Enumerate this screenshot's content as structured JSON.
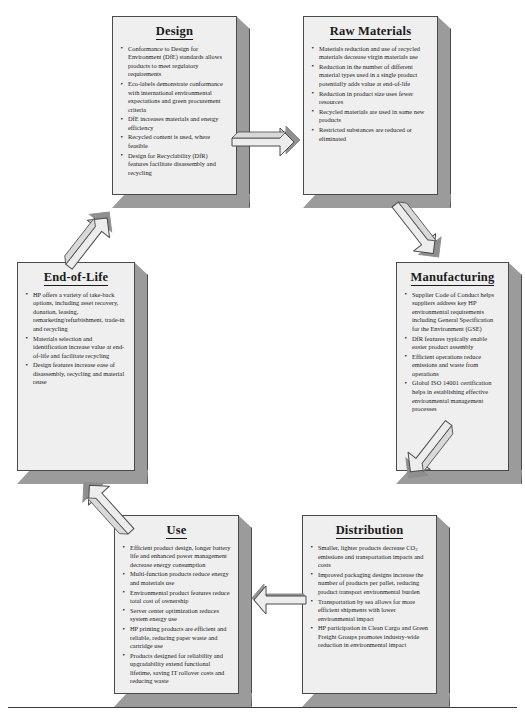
{
  "diagram": {
    "type": "cycle-flow",
    "colors": {
      "box_face": "#efefef",
      "box_shadow": "#9b9b9b",
      "outline": "#4a4a4a",
      "arrow_fill": "#ededed",
      "arrow_shadow": "#8f8f8f",
      "text": "#1a1a1a"
    },
    "stages": [
      {
        "id": "design",
        "title": "Design",
        "bullets": [
          "Conformance to Design for Environment (DfE) standards allows products to meet regulatory requirements",
          "Eco-labels demonstrate conformance with international environmental expectations and green procurement criteria",
          "DfE increases materials and energy efficiency",
          "Recycled content is used, where feasible",
          "Design for Recyclability (DfR) features facilitate disassembly and recycling"
        ]
      },
      {
        "id": "raw-materials",
        "title": "Raw Materials",
        "bullets": [
          "Materials reduction and use of recycled materials decrease virgin materials use",
          "Reduction in the number of different material types used in a single product potentially adds value at end-of-life",
          "Reduction in product size uses fewer resources",
          "Recycled materials are used in some new products",
          "Restricted substances are reduced or eliminated"
        ]
      },
      {
        "id": "manufacturing",
        "title": "Manufacturing",
        "bullets": [
          "Supplier Code of Conduct helps suppliers address key HP environmental requirements including General Specification for the Environment (GSE)",
          "DfR features typically enable easier product assembly",
          "Efficient operations reduce emissions and waste from operations",
          "Global ISO 14001 certification helps in establishing effective environmental management processes"
        ]
      },
      {
        "id": "distribution",
        "title": "Distribution",
        "bullets": [
          "Smaller, lighter products decrease CO2 emissions and transportation impacts and costs",
          "Improved packaging designs increase the number of products per pallet, reducing product transport environmental burden",
          "Transportation by sea allows for more efficient shipments with lower environmental impact",
          "HP participation in Clean Cargo and Green Freight Groups promotes industry-wide reduction in environmental impact"
        ]
      },
      {
        "id": "use",
        "title": "Use",
        "bullets": [
          "Efficient product design, longer battery life and enhanced power management decrease energy consumption",
          "Multi-function products reduce energy and materials use",
          "Environmental product features reduce total cost of ownership",
          "Server center optimization reduces system energy use",
          "HP printing products are efficient and reliable, reducing paper waste and cartridge use",
          "Products designed for reliability and upgradability extend functional lifetime, saving IT rollover costs and reducing waste"
        ]
      },
      {
        "id": "end-of-life",
        "title": "End-of-Life",
        "bullets": [
          "HP offers a variety of take-back options, including asset recovery, donation, leasing, remarketing/refurbishment, trade-in and recycling",
          "Materials selection and identification increase value at end-of-life and facilitate recycling",
          "Design features increase ease of disassembly, recycling and material reuse"
        ]
      }
    ],
    "arrows": [
      {
        "id": "design-to-raw-materials",
        "from": "design",
        "to": "raw-materials",
        "direction": "right"
      },
      {
        "id": "raw-materials-to-manufacturing",
        "from": "raw-materials",
        "to": "manufacturing",
        "direction": "down-right"
      },
      {
        "id": "manufacturing-to-distribution",
        "from": "manufacturing",
        "to": "distribution",
        "direction": "down-left"
      },
      {
        "id": "distribution-to-use",
        "from": "distribution",
        "to": "use",
        "direction": "left"
      },
      {
        "id": "use-to-end-of-life",
        "from": "use",
        "to": "end-of-life",
        "direction": "up-left"
      },
      {
        "id": "end-of-life-to-design",
        "from": "end-of-life",
        "to": "design",
        "direction": "up-right"
      }
    ]
  }
}
